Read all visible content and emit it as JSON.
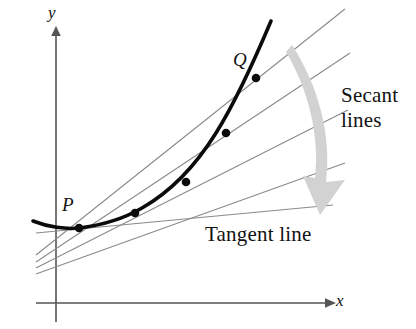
{
  "figure": {
    "background_color": "#ffffff",
    "width": 416,
    "height": 329
  },
  "axes": {
    "x_label": "x",
    "y_label": "y",
    "axis_color": "#555555",
    "x_axis": {
      "y": 303,
      "x_start": 36,
      "x_end": 332
    },
    "y_axis": {
      "x": 56,
      "y_start": 28,
      "y_end": 322
    }
  },
  "points": [
    {
      "name": "P",
      "label": "P",
      "x": 79,
      "y": 228,
      "labeled": true
    },
    {
      "name": "S1",
      "label": "",
      "x": 135,
      "y": 213,
      "labeled": false
    },
    {
      "name": "S2",
      "label": "",
      "x": 186,
      "y": 182,
      "labeled": false
    },
    {
      "name": "S3",
      "label": "",
      "x": 226,
      "y": 133,
      "labeled": false
    },
    {
      "name": "Q",
      "label": "Q",
      "x": 256,
      "y": 78,
      "labeled": true
    }
  ],
  "annotations": {
    "secant_line_1": "Secant",
    "secant_line_2": "lines",
    "tangent": "Tangent line"
  },
  "colors": {
    "curve": "#0b0b0b",
    "secant": "#8a8a8a",
    "tangent": "#8a8a8a",
    "arrow": "#cfcfcf",
    "axis": "#555555",
    "text": "#121212"
  },
  "elements": {
    "curve_name": "parabola-curve",
    "arrow_name": "curved-gray-arrow"
  }
}
